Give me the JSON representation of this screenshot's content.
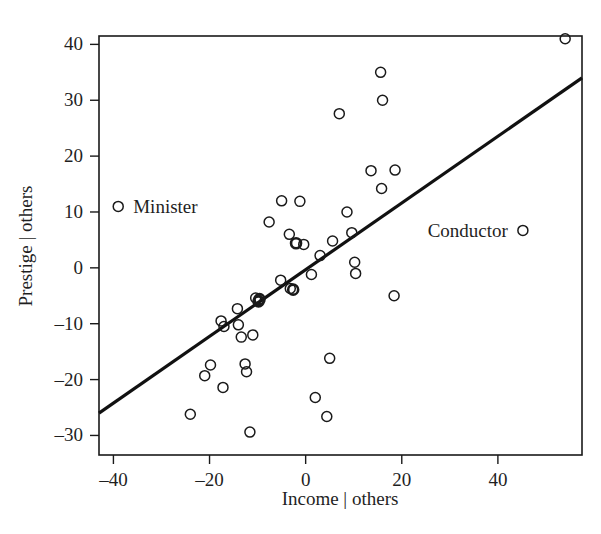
{
  "chart_data": {
    "type": "scatter",
    "title": "",
    "xlabel": "Income | others",
    "ylabel": "Prestige | others",
    "xlim": [
      -43.0,
      57.5
    ],
    "ylim": [
      -33.5,
      41.5
    ],
    "xticks": [
      -40,
      -20,
      0,
      20,
      40
    ],
    "xtick_labels": [
      "–40",
      "–20",
      "0",
      "20",
      "40"
    ],
    "yticks": [
      -30,
      -20,
      -10,
      0,
      10,
      20,
      30,
      40
    ],
    "ytick_labels": [
      "–30",
      "–20",
      "–10",
      "0",
      "10",
      "20",
      "30",
      "40"
    ],
    "grid": false,
    "legend": "none",
    "marker": "open-circle",
    "points": [
      {
        "x": -39.0,
        "y": 11.0,
        "label": "Minister",
        "label_pos": "right"
      },
      {
        "x": -24.0,
        "y": -26.2,
        "label": "",
        "label_pos": ""
      },
      {
        "x": -21.0,
        "y": -19.3,
        "label": "",
        "label_pos": ""
      },
      {
        "x": -19.8,
        "y": -17.4,
        "label": "",
        "label_pos": ""
      },
      {
        "x": -17.6,
        "y": -9.5,
        "label": "",
        "label_pos": ""
      },
      {
        "x": -17.0,
        "y": -10.5,
        "label": "",
        "label_pos": ""
      },
      {
        "x": -17.2,
        "y": -21.4,
        "label": "",
        "label_pos": ""
      },
      {
        "x": -14.0,
        "y": -10.2,
        "label": "",
        "label_pos": ""
      },
      {
        "x": -14.2,
        "y": -7.3,
        "label": "",
        "label_pos": ""
      },
      {
        "x": -13.4,
        "y": -12.4,
        "label": "",
        "label_pos": ""
      },
      {
        "x": -12.6,
        "y": -17.2,
        "label": "",
        "label_pos": ""
      },
      {
        "x": -12.3,
        "y": -18.6,
        "label": "",
        "label_pos": ""
      },
      {
        "x": -11.6,
        "y": -29.4,
        "label": "",
        "label_pos": ""
      },
      {
        "x": -11.0,
        "y": -12.0,
        "label": "",
        "label_pos": ""
      },
      {
        "x": -10.4,
        "y": -5.4,
        "label": "",
        "label_pos": ""
      },
      {
        "x": -9.8,
        "y": -6.0,
        "label": "",
        "label_pos": ""
      },
      {
        "x": -9.6,
        "y": -5.6,
        "label": "",
        "label_pos": ""
      },
      {
        "x": -7.6,
        "y": 8.2,
        "label": "",
        "label_pos": ""
      },
      {
        "x": -5.0,
        "y": 12.0,
        "label": "",
        "label_pos": ""
      },
      {
        "x": -5.2,
        "y": -2.2,
        "label": "",
        "label_pos": ""
      },
      {
        "x": -3.4,
        "y": 6.0,
        "label": "",
        "label_pos": ""
      },
      {
        "x": -3.2,
        "y": -3.7,
        "label": "",
        "label_pos": ""
      },
      {
        "x": -2.6,
        "y": -3.9,
        "label": "",
        "label_pos": ""
      },
      {
        "x": -2.0,
        "y": 4.4,
        "label": "",
        "label_pos": ""
      },
      {
        "x": -1.2,
        "y": 11.9,
        "label": "",
        "label_pos": ""
      },
      {
        "x": -0.4,
        "y": 4.2,
        "label": "",
        "label_pos": ""
      },
      {
        "x": 1.2,
        "y": -1.2,
        "label": "",
        "label_pos": ""
      },
      {
        "x": 2.0,
        "y": -23.2,
        "label": "",
        "label_pos": ""
      },
      {
        "x": 3.0,
        "y": 2.2,
        "label": "",
        "label_pos": ""
      },
      {
        "x": 4.4,
        "y": -26.6,
        "label": "",
        "label_pos": ""
      },
      {
        "x": 5.0,
        "y": -16.2,
        "label": "",
        "label_pos": ""
      },
      {
        "x": 5.6,
        "y": 4.8,
        "label": "",
        "label_pos": ""
      },
      {
        "x": 7.0,
        "y": 27.6,
        "label": "",
        "label_pos": ""
      },
      {
        "x": 8.6,
        "y": 10.0,
        "label": "",
        "label_pos": ""
      },
      {
        "x": 9.6,
        "y": 6.3,
        "label": "",
        "label_pos": ""
      },
      {
        "x": 10.2,
        "y": 1.0,
        "label": "",
        "label_pos": ""
      },
      {
        "x": 10.4,
        "y": -1.0,
        "label": "",
        "label_pos": ""
      },
      {
        "x": 13.6,
        "y": 17.4,
        "label": "",
        "label_pos": ""
      },
      {
        "x": 15.6,
        "y": 35.0,
        "label": "",
        "label_pos": ""
      },
      {
        "x": 16.0,
        "y": 30.0,
        "label": "",
        "label_pos": ""
      },
      {
        "x": 15.8,
        "y": 14.2,
        "label": "",
        "label_pos": ""
      },
      {
        "x": 18.6,
        "y": 17.5,
        "label": "",
        "label_pos": ""
      },
      {
        "x": 18.4,
        "y": -5.0,
        "label": "",
        "label_pos": ""
      },
      {
        "x": 45.2,
        "y": 6.7,
        "label": "Conductor",
        "label_pos": "left"
      },
      {
        "x": 54.0,
        "y": 41.0,
        "label": "",
        "label_pos": ""
      }
    ],
    "emphasized_points": [
      {
        "x": -9.8,
        "y": -6.0
      },
      {
        "x": -9.6,
        "y": -5.6
      },
      {
        "x": -2.6,
        "y": -3.9
      },
      {
        "x": -2.0,
        "y": 4.4
      }
    ],
    "regression_line": {
      "x_start": -43.0,
      "y_start": -26.0,
      "x_end": 57.5,
      "y_end": 34.0,
      "slope": 0.597,
      "intercept": -0.33
    },
    "annotations": [
      {
        "text": "Minister",
        "x": -39.0,
        "y": 11.0,
        "anchor": "start"
      },
      {
        "text": "Conductor",
        "x": 45.2,
        "y": 6.7,
        "anchor": "end"
      }
    ]
  }
}
